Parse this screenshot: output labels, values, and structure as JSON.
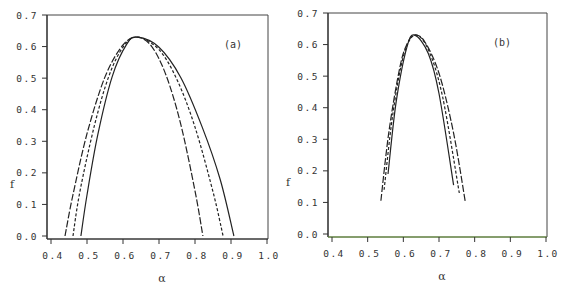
{
  "chart_data": [
    {
      "type": "line",
      "panel_label": "(a)",
      "xlabel": "α",
      "ylabel": "f",
      "xlim": [
        0.4,
        1.0
      ],
      "ylim": [
        0.0,
        0.7
      ],
      "xticks": [
        "0.4",
        "0.5",
        "0.6",
        "0.7",
        "0.8",
        "0.9",
        "1.0"
      ],
      "yticks": [
        "0.0",
        "0.1",
        "0.2",
        "0.3",
        "0.4",
        "0.5",
        "0.6",
        "0.7"
      ],
      "grid": false,
      "series": [
        {
          "name": "long-dash curve",
          "style": "longdash",
          "x": [
            0.439,
            0.46,
            0.5,
            0.55,
            0.6,
            0.64,
            0.68,
            0.72,
            0.76,
            0.8,
            0.822
          ],
          "y": [
            0.0,
            0.125,
            0.324,
            0.504,
            0.605,
            0.63,
            0.6,
            0.508,
            0.356,
            0.143,
            0.0
          ]
        },
        {
          "name": "short-dash curve",
          "style": "dash",
          "x": [
            0.461,
            0.48,
            0.52,
            0.56,
            0.6,
            0.64,
            0.7,
            0.75,
            0.8,
            0.85,
            0.878
          ],
          "y": [
            0.0,
            0.139,
            0.347,
            0.504,
            0.598,
            0.63,
            0.59,
            0.495,
            0.345,
            0.14,
            0.0
          ]
        },
        {
          "name": "solid curve",
          "style": "solid",
          "x": [
            0.483,
            0.5,
            0.53,
            0.57,
            0.61,
            0.64,
            0.7,
            0.76,
            0.82,
            0.87,
            0.908
          ],
          "y": [
            0.0,
            0.13,
            0.321,
            0.505,
            0.607,
            0.63,
            0.598,
            0.503,
            0.345,
            0.179,
            0.0
          ]
        }
      ]
    },
    {
      "type": "line",
      "panel_label": "(b)",
      "xlabel": "α",
      "ylabel": "f",
      "xlim": [
        0.4,
        1.0
      ],
      "ylim": [
        0.0,
        0.7
      ],
      "xticks": [
        "0.4",
        "0.5",
        "0.6",
        "0.7",
        "0.8",
        "0.9",
        "1.0"
      ],
      "yticks": [
        "0.0",
        "0.1",
        "0.2",
        "0.3",
        "0.4",
        "0.5",
        "0.6",
        "0.7"
      ],
      "grid": false,
      "series": [
        {
          "name": "outer curve",
          "style": "longdash",
          "x": [
            0.537,
            0.56,
            0.59,
            0.61,
            0.632,
            0.66,
            0.7,
            0.74,
            0.774
          ],
          "y": [
            0.105,
            0.328,
            0.527,
            0.601,
            0.63,
            0.609,
            0.509,
            0.324,
            0.1
          ]
        },
        {
          "name": "middle curve",
          "style": "dash",
          "x": [
            0.546,
            0.57,
            0.6,
            0.632,
            0.67,
            0.71,
            0.757
          ],
          "y": [
            0.14,
            0.375,
            0.562,
            0.63,
            0.584,
            0.435,
            0.13
          ]
        },
        {
          "name": "inner curve",
          "style": "solid",
          "x": [
            0.557,
            0.58,
            0.61,
            0.632,
            0.67,
            0.7,
            0.741
          ],
          "y": [
            0.19,
            0.419,
            0.592,
            0.63,
            0.572,
            0.445,
            0.155
          ]
        }
      ]
    }
  ]
}
